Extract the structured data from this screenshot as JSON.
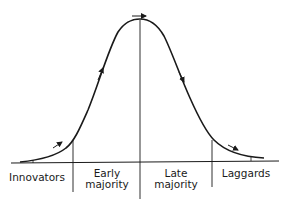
{
  "diagram": {
    "type": "diffusion-of-innovation-bell-curve",
    "colors": {
      "line": "#1a1a1a",
      "background": "#ffffff"
    },
    "segments": [
      {
        "id": "innovators",
        "lines": [
          "Innovators"
        ]
      },
      {
        "id": "early-majority",
        "lines": [
          "Early",
          "majority"
        ]
      },
      {
        "id": "late-majority",
        "lines": [
          "Late",
          "majority"
        ]
      },
      {
        "id": "laggards",
        "lines": [
          "Laggards"
        ]
      }
    ],
    "arrows": [
      {
        "position": "lower-left",
        "direction": "up-right"
      },
      {
        "position": "upper-left",
        "direction": "up"
      },
      {
        "position": "peak",
        "direction": "right"
      },
      {
        "position": "upper-right",
        "direction": "down"
      },
      {
        "position": "lower-right",
        "direction": "down-right"
      }
    ]
  }
}
